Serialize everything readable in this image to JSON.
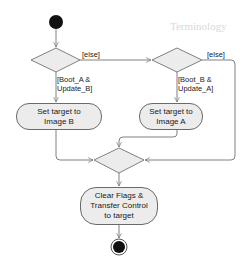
{
  "diagram": {
    "type": "uml-activity-diagram",
    "nodes": {
      "start": {
        "kind": "initial-node"
      },
      "decision_1": {
        "kind": "decision",
        "guard_yes": "[Boot_A & Update_B]",
        "guard_else": "[else]"
      },
      "decision_2": {
        "kind": "decision",
        "guard_yes": "[Boot_B & Update_A]",
        "guard_else": "[else]"
      },
      "action_image_b": {
        "kind": "action",
        "line1": "Set target to",
        "line2": "Image B"
      },
      "action_image_a": {
        "kind": "action",
        "line1": "Set target to",
        "line2": "Image A"
      },
      "merge": {
        "kind": "merge"
      },
      "action_clear": {
        "kind": "action",
        "line1": "Clear Flags &",
        "line2": "Transfer Control",
        "line3": "to target"
      },
      "end": {
        "kind": "final-node"
      }
    },
    "labels": {
      "else_1": "[else]",
      "else_2": "[else]",
      "guard_1_line1": "[Boot_A &",
      "guard_1_line2": "Update_B]",
      "guard_2_line1": "[Boot_B &",
      "guard_2_line2": "Update_A]"
    },
    "edges": [
      {
        "from": "start",
        "to": "decision_1"
      },
      {
        "from": "decision_1",
        "to": "action_image_b",
        "guard": "[Boot_A & Update_B]"
      },
      {
        "from": "decision_1",
        "to": "decision_2",
        "guard": "[else]"
      },
      {
        "from": "decision_2",
        "to": "action_image_a",
        "guard": "[Boot_B & Update_A]"
      },
      {
        "from": "decision_2",
        "to": "merge",
        "guard": "[else]"
      },
      {
        "from": "action_image_b",
        "to": "merge"
      },
      {
        "from": "action_image_a",
        "to": "merge"
      },
      {
        "from": "merge",
        "to": "action_clear"
      },
      {
        "from": "action_clear",
        "to": "end"
      }
    ],
    "colors": {
      "stroke": "#777777",
      "fill": "#ececec",
      "node_fill": "#111111",
      "text": "#222222"
    }
  },
  "background_text": {
    "heading_fragment": "Terminology"
  }
}
